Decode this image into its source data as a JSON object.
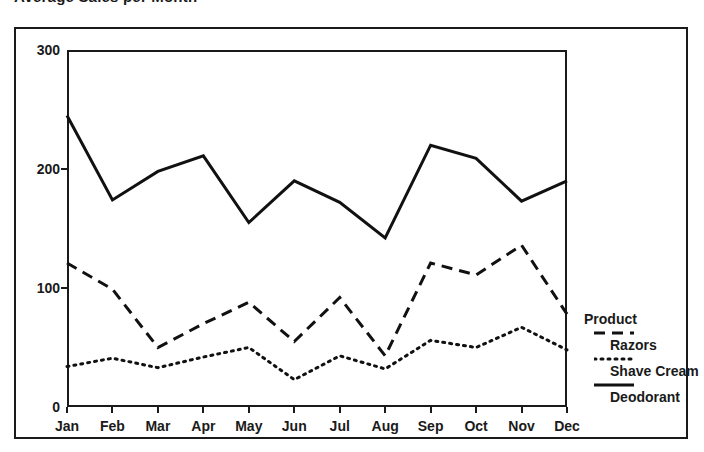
{
  "chart_title": "Average Sales per Month",
  "legend": {
    "title": "Product",
    "entries": [
      {
        "label": "Razors",
        "style": "dashed"
      },
      {
        "label": "Shave Cream",
        "style": "dotted"
      },
      {
        "label": "Deodorant",
        "style": "solid"
      }
    ]
  },
  "chart_data": {
    "type": "line",
    "title": "Average Sales per Month",
    "xlabel": "",
    "ylabel": "",
    "categories": [
      "Jan",
      "Feb",
      "Mar",
      "Apr",
      "May",
      "Jun",
      "Jul",
      "Aug",
      "Sep",
      "Oct",
      "Nov",
      "Dec"
    ],
    "ylim": [
      0,
      300
    ],
    "yticks": [
      0,
      100,
      200,
      300
    ],
    "grid": false,
    "legend_position": "right",
    "series": [
      {
        "name": "Razors",
        "style": "dashed",
        "color": "#111111",
        "values": [
          121,
          99,
          50,
          70,
          88,
          55,
          92,
          43,
          121,
          111,
          136,
          78
        ]
      },
      {
        "name": "Shave Cream",
        "style": "dotted",
        "color": "#111111",
        "values": [
          34,
          41,
          33,
          42,
          50,
          23,
          43,
          32,
          56,
          50,
          67,
          48
        ]
      },
      {
        "name": "Deodorant",
        "style": "solid",
        "color": "#111111",
        "values": [
          245,
          174,
          198,
          211,
          155,
          190,
          172,
          142,
          220,
          209,
          173,
          190
        ]
      }
    ]
  }
}
